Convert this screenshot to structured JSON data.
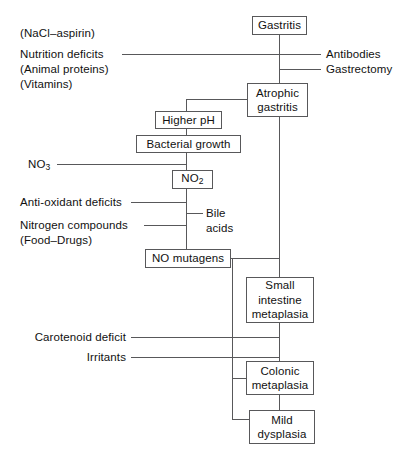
{
  "diagram": {
    "type": "flowchart",
    "colors": {
      "line": "#58585a",
      "text": "#111111",
      "background": "#ffffff"
    },
    "nodes": [
      {
        "id": "gastritis",
        "label": "Gastritis"
      },
      {
        "id": "atrophic-gastritis",
        "label": "Atrophic\ngastritis",
        "line1": "Atrophic",
        "line2": "gastritis"
      },
      {
        "id": "higher-ph",
        "label": "Higher pH"
      },
      {
        "id": "bacterial-growth",
        "label": "Bacterial growth"
      },
      {
        "id": "no2",
        "label": "NO2",
        "base": "NO",
        "subscript": "2"
      },
      {
        "id": "no-mutagens",
        "label": "NO mutagens"
      },
      {
        "id": "small-intestine-metaplasia",
        "line1": "Small",
        "line2": "intestine",
        "line3": "metaplasia"
      },
      {
        "id": "colonic-metaplasia",
        "line1": "Colonic",
        "line2": "metaplasia"
      },
      {
        "id": "mild-dysplasia",
        "line1": "Mild",
        "line2": "dysplasia"
      }
    ],
    "left_labels": [
      {
        "id": "nacl-aspirin",
        "text": "(NaCl–aspirin)"
      },
      {
        "id": "nutrition-deficits",
        "text": "Nutrition deficits"
      },
      {
        "id": "animal-proteins",
        "text": "(Animal proteins)"
      },
      {
        "id": "vitamins",
        "text": "(Vitamins)"
      },
      {
        "id": "no3",
        "base": "NO",
        "subscript": "3"
      },
      {
        "id": "anti-oxidant-deficits",
        "text": "Anti-oxidant deficits"
      },
      {
        "id": "nitrogen-compounds",
        "text": "Nitrogen compounds"
      },
      {
        "id": "food-drugs",
        "text": "(Food–Drugs)"
      },
      {
        "id": "carotenoid-deficit",
        "text": "Carotenoid deficit"
      },
      {
        "id": "irritants",
        "text": "Irritants"
      }
    ],
    "right_labels": [
      {
        "id": "antibodies",
        "text": "Antibodies"
      },
      {
        "id": "gastrectomy",
        "text": "Gastrectomy"
      }
    ],
    "mid_labels": [
      {
        "id": "bile-acids",
        "line1": "Bile",
        "line2": "acids"
      }
    ]
  }
}
